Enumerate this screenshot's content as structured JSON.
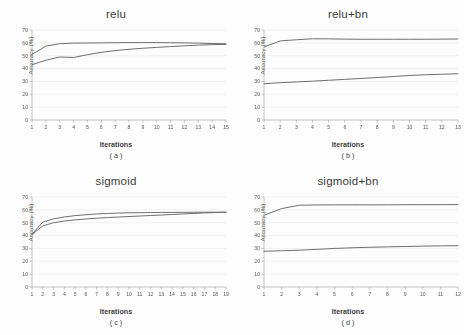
{
  "figure": {
    "background": "#fdfdfd",
    "line_color": "#6e6e6e",
    "grid_color": "#e4e4e4",
    "axis_color": "#9a9a9a",
    "layout": "2x2"
  },
  "chart_data": [
    {
      "type": "line",
      "title": "relu",
      "caption": "( a )",
      "xlabel": "Iterations",
      "ylabel": "Accuracy (%)",
      "x": [
        1,
        2,
        3,
        4,
        5,
        6,
        7,
        8,
        9,
        10,
        11,
        12,
        13,
        14,
        15
      ],
      "xticklabels": [
        "1",
        "2",
        "3",
        "4",
        "5",
        "6",
        "7",
        "8",
        "9",
        "10",
        "11",
        "12",
        "13",
        "14",
        "15"
      ],
      "yticklabels": [
        "0",
        "10",
        "20",
        "30",
        "40",
        "50",
        "60",
        "70"
      ],
      "ylim": [
        0,
        70
      ],
      "ytick_step": 10,
      "grid": true,
      "legend": "none",
      "series": [
        {
          "name": "upper",
          "values": [
            51.0,
            57.5,
            59.3,
            59.8,
            59.9,
            60.0,
            60.1,
            60.2,
            60.2,
            60.2,
            60.1,
            60.0,
            59.8,
            59.5,
            59.3
          ]
        },
        {
          "name": "lower",
          "values": [
            43.0,
            46.5,
            49.0,
            48.6,
            50.8,
            52.6,
            54.0,
            55.0,
            55.8,
            56.5,
            57.1,
            57.7,
            58.2,
            58.6,
            58.8
          ]
        }
      ]
    },
    {
      "type": "line",
      "title": "relu+bn",
      "caption": "( b )",
      "xlabel": "Iterations",
      "ylabel": "Accuracy (%)",
      "x": [
        1,
        2,
        3,
        4,
        5,
        6,
        7,
        8,
        9,
        10,
        11,
        12,
        13
      ],
      "xticklabels": [
        "1",
        "2",
        "3",
        "4",
        "5",
        "6",
        "7",
        "8",
        "9",
        "10",
        "11",
        "12",
        "13"
      ],
      "yticklabels": [
        "0",
        "10",
        "20",
        "30",
        "40",
        "50",
        "60",
        "70"
      ],
      "ylim": [
        0,
        70
      ],
      "ytick_step": 10,
      "grid": true,
      "legend": "none",
      "series": [
        {
          "name": "upper",
          "values": [
            56.8,
            61.5,
            62.4,
            63.2,
            63.1,
            62.9,
            62.8,
            62.8,
            62.8,
            62.8,
            62.8,
            62.9,
            63.0
          ]
        },
        {
          "name": "lower",
          "values": [
            28.2,
            29.0,
            29.6,
            30.2,
            30.9,
            31.6,
            32.3,
            33.0,
            33.8,
            34.6,
            35.2,
            35.6,
            36.0
          ]
        }
      ]
    },
    {
      "type": "line",
      "title": "sigmoid",
      "caption": "( c )",
      "xlabel": "Iterations",
      "ylabel": "Accuracy (%)",
      "x": [
        1,
        2,
        3,
        4,
        5,
        6,
        7,
        8,
        9,
        10,
        11,
        12,
        13,
        14,
        15,
        16,
        17,
        18,
        19
      ],
      "xticklabels": [
        "1",
        "2",
        "3",
        "4",
        "5",
        "6",
        "7",
        "8",
        "9",
        "10",
        "11",
        "12",
        "13",
        "14",
        "15",
        "16",
        "17",
        "18",
        "19"
      ],
      "yticklabels": [
        "0",
        "10",
        "20",
        "30",
        "40",
        "50",
        "60",
        "70"
      ],
      "ylim": [
        0,
        70
      ],
      "ytick_step": 10,
      "grid": true,
      "legend": "none",
      "series": [
        {
          "name": "upper",
          "values": [
            41.0,
            50.5,
            53.0,
            54.5,
            55.5,
            56.2,
            56.8,
            57.2,
            57.5,
            57.7,
            57.8,
            57.9,
            58.0,
            58.0,
            58.1,
            58.1,
            58.2,
            58.2,
            58.2
          ]
        },
        {
          "name": "lower",
          "values": [
            40.8,
            47.5,
            50.0,
            51.3,
            52.2,
            52.9,
            53.5,
            54.0,
            54.4,
            54.8,
            55.2,
            55.6,
            56.0,
            56.4,
            56.8,
            57.2,
            57.6,
            57.9,
            58.1
          ]
        }
      ]
    },
    {
      "type": "line",
      "title": "sigmoid+bn",
      "caption": "( d )",
      "xlabel": "Iterations",
      "ylabel": "Accuracy (%)",
      "x": [
        1,
        2,
        3,
        4,
        5,
        6,
        7,
        8,
        9,
        10,
        11,
        12
      ],
      "xticklabels": [
        "1",
        "2",
        "3",
        "4",
        "5",
        "6",
        "7",
        "8",
        "9",
        "10",
        "11",
        "12"
      ],
      "yticklabels": [
        "0",
        "10",
        "20",
        "30",
        "40",
        "50",
        "60",
        "70"
      ],
      "ylim": [
        0,
        70
      ],
      "ytick_step": 10,
      "grid": true,
      "legend": "none",
      "series": [
        {
          "name": "upper",
          "values": [
            55.8,
            61.0,
            63.6,
            63.8,
            63.9,
            63.9,
            63.9,
            63.9,
            64.0,
            64.0,
            64.0,
            64.1
          ]
        },
        {
          "name": "lower",
          "values": [
            27.8,
            28.2,
            28.6,
            29.3,
            30.0,
            30.5,
            30.9,
            31.2,
            31.5,
            31.8,
            32.0,
            32.1
          ]
        }
      ]
    }
  ]
}
